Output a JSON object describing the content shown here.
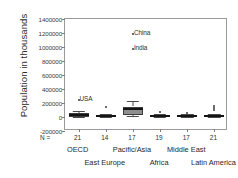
{
  "chart_data": {
    "type": "box",
    "title": "",
    "xlabel": "",
    "ylabel": "Population in thousands",
    "ylim": [
      -200000,
      1400000
    ],
    "ytick_labels": [
      "1400000",
      "1200000",
      "1000000",
      "800000",
      "600000",
      "400000",
      "200000",
      "0",
      "-200000"
    ],
    "ytick_values": [
      1400000,
      1200000,
      1000000,
      800000,
      600000,
      400000,
      200000,
      0,
      -200000
    ],
    "grid": false,
    "legend": null,
    "categories": [
      "OECD",
      "East Europe",
      "Pacific/Asia",
      "Africa",
      "Middle East",
      "Latin America"
    ],
    "n_label": "N =",
    "n_values": [
      21,
      14,
      17,
      19,
      17,
      21
    ],
    "series": [
      {
        "name": "OECD",
        "q1": 5000,
        "median": 25000,
        "q3": 58000,
        "whisker_low": 4000,
        "whisker_high": 82000,
        "outliers": []
      },
      {
        "name": "East Europe",
        "q1": 4000,
        "median": 10000,
        "q3": 22000,
        "whisker_low": 2000,
        "whisker_high": 39000,
        "outliers": [
          147000
        ]
      },
      {
        "name": "Pacific/Asia",
        "q1": 22000,
        "median": 112000,
        "q3": 150000,
        "whisker_low": 12000,
        "whisker_high": 235000,
        "outliers": [
          1190000,
          970000
        ]
      },
      {
        "name": "Africa",
        "q1": 4000,
        "median": 12000,
        "q3": 26000,
        "whisker_low": 2000,
        "whisker_high": 42000,
        "outliers": [
          66000
        ]
      },
      {
        "name": "Middle East",
        "q1": 3000,
        "median": 11000,
        "q3": 24000,
        "whisker_low": 1500,
        "whisker_high": 38000,
        "outliers": [
          64000
        ]
      },
      {
        "name": "Latin America",
        "q1": 4000,
        "median": 12000,
        "q3": 26000,
        "whisker_low": 2000,
        "whisker_high": 40000,
        "outliers": [
          95000,
          125000,
          160000
        ]
      }
    ],
    "annotations": [
      {
        "label": "China",
        "value": 1190000,
        "category": "Pacific/Asia"
      },
      {
        "label": "India",
        "value": 970000,
        "category": "Pacific/Asia"
      },
      {
        "label": "USA",
        "value": 250000,
        "category": "OECD"
      }
    ]
  }
}
